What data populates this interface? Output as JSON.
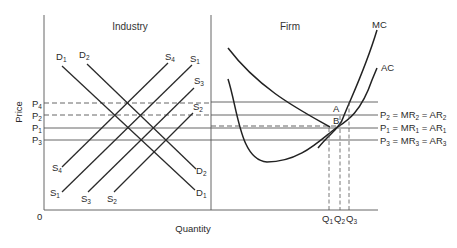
{
  "diagram": {
    "axes": {
      "y_label": "Price",
      "x_label": "Quantity",
      "origin_label": "0"
    },
    "panels": {
      "left_title": "Industry",
      "right_title": "Firm"
    },
    "industry": {
      "price_levels": [
        {
          "base": "P",
          "sub": "4"
        },
        {
          "base": "P",
          "sub": "2"
        },
        {
          "base": "P",
          "sub": "1"
        },
        {
          "base": "P",
          "sub": "3"
        }
      ],
      "demand_curves": [
        {
          "base": "D",
          "sub": "1"
        },
        {
          "base": "D",
          "sub": "2"
        }
      ],
      "supply_curves": [
        {
          "base": "S",
          "sub": "4"
        },
        {
          "base": "S",
          "sub": "1"
        },
        {
          "base": "S",
          "sub": "3"
        },
        {
          "base": "S",
          "sub": "2"
        }
      ]
    },
    "firm": {
      "cost_curves": {
        "mc": "MC",
        "ac": "AC"
      },
      "points": {
        "a": "A",
        "b": "B"
      },
      "revenue_lines": [
        {
          "p": "2",
          "text_mr": "MR",
          "text_ar": "AR",
          "sub": "2",
          "eq": "="
        },
        {
          "p": "1",
          "text_mr": "MR",
          "text_ar": "AR",
          "sub": "1",
          "eq": "="
        },
        {
          "p": "3",
          "text_mr": "MR",
          "text_ar": "AR",
          "sub": "3",
          "eq": "="
        }
      ],
      "quantities": [
        {
          "base": "Q",
          "sub": "1"
        },
        {
          "base": "Q",
          "sub": "2"
        },
        {
          "base": "Q",
          "sub": "3"
        }
      ]
    }
  }
}
